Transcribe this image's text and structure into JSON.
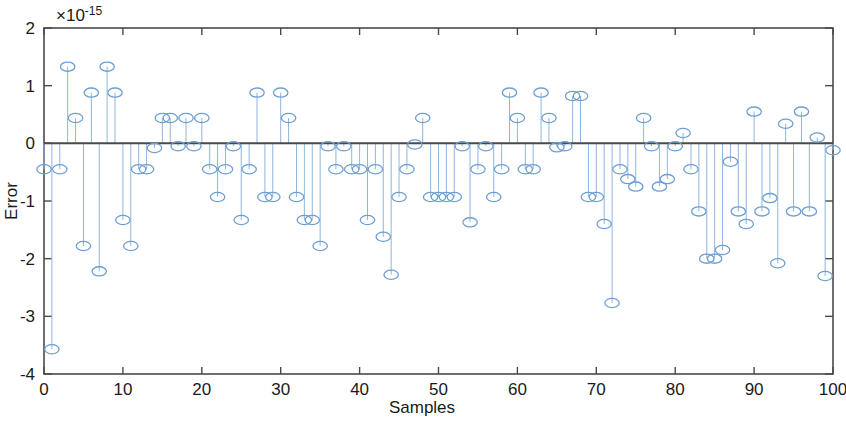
{
  "chart_data": {
    "type": "scatter",
    "plot_style": "stem",
    "title": "",
    "xlabel": "Samples",
    "ylabel": "Error",
    "y_exponent_label": "×10",
    "y_exponent_value": "-15",
    "y_scale_factor": 1e-15,
    "xlim": [
      0,
      100
    ],
    "ylim": [
      -4,
      2
    ],
    "xticks": [
      0,
      10,
      20,
      30,
      40,
      50,
      60,
      70,
      80,
      90,
      100
    ],
    "xticklabels": [
      "0",
      "10",
      "20",
      "30",
      "40",
      "50",
      "60",
      "70",
      "80",
      "90",
      "100"
    ],
    "yticks": [
      2,
      1,
      0,
      -1,
      -2,
      -3,
      -4
    ],
    "yticklabels": [
      "2",
      "1",
      "0",
      "-1",
      "-2",
      "-3",
      "-4"
    ],
    "grid": false,
    "legend": null,
    "marker": "open-circle",
    "marker_color": "#6d9fd4",
    "stem_color": "#8fb6de",
    "baseline_color": "#4a4a4a",
    "axes_color": "#4a4a4a",
    "x": [
      0,
      1,
      2,
      3,
      4,
      5,
      6,
      7,
      8,
      9,
      10,
      11,
      12,
      13,
      14,
      15,
      16,
      17,
      18,
      19,
      20,
      21,
      22,
      23,
      24,
      25,
      26,
      27,
      28,
      29,
      30,
      31,
      32,
      33,
      34,
      35,
      36,
      37,
      38,
      39,
      40,
      41,
      42,
      43,
      44,
      45,
      46,
      47,
      48,
      49,
      50,
      51,
      52,
      53,
      54,
      55,
      56,
      57,
      58,
      59,
      60,
      61,
      62,
      63,
      64,
      65,
      66,
      67,
      68,
      69,
      70,
      71,
      72,
      73,
      74,
      75,
      76,
      77,
      78,
      79,
      80,
      81,
      82,
      83,
      84,
      85,
      86,
      87,
      88,
      89,
      90,
      91,
      92,
      93,
      94,
      95,
      96,
      97,
      98,
      99,
      100
    ],
    "values": [
      -0.45,
      -3.57,
      -0.45,
      1.33,
      0.44,
      -1.78,
      0.88,
      -2.22,
      1.33,
      0.88,
      -1.33,
      -1.78,
      -0.45,
      -0.45,
      -0.08,
      0.44,
      0.44,
      -0.05,
      0.44,
      -0.05,
      0.44,
      -0.45,
      -0.93,
      -0.45,
      -0.05,
      -1.33,
      -0.45,
      0.88,
      -0.93,
      -0.93,
      0.88,
      0.44,
      -0.93,
      -1.33,
      -1.33,
      -1.78,
      -0.05,
      -0.45,
      -0.05,
      -0.45,
      -0.45,
      -1.33,
      -0.45,
      -1.62,
      -2.28,
      -0.93,
      -0.45,
      -0.02,
      0.44,
      -0.93,
      -0.93,
      -0.93,
      -0.93,
      -0.05,
      -1.37,
      -0.45,
      -0.05,
      -0.93,
      -0.45,
      0.88,
      0.44,
      -0.45,
      -0.45,
      0.88,
      0.44,
      -0.07,
      -0.05,
      0.82,
      0.82,
      -0.93,
      -0.93,
      -1.4,
      -2.77,
      -0.45,
      -0.62,
      -0.75,
      0.44,
      -0.05,
      -0.75,
      -0.62,
      -0.05,
      0.18,
      -0.45,
      -1.18,
      -2.0,
      -2.0,
      -1.85,
      -0.32,
      -1.18,
      -1.4,
      0.55,
      -1.18,
      -0.95,
      -2.08,
      0.34,
      -1.18,
      0.55,
      -1.18,
      0.1,
      -2.3,
      -0.12
    ]
  },
  "axis": {
    "x_title": "Samples",
    "y_title": "Error"
  }
}
